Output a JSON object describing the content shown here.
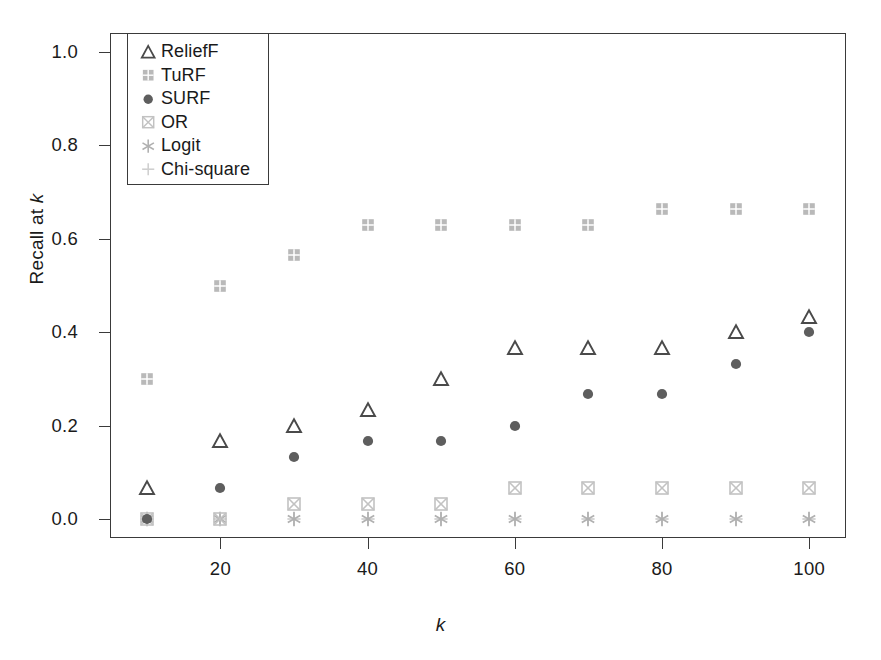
{
  "chart_data": {
    "type": "scatter",
    "title": "",
    "xlabel": "k",
    "ylabel": "Recall at k",
    "xlim": [
      5,
      105
    ],
    "ylim": [
      -0.04,
      1.04
    ],
    "grid": false,
    "legend_position": "top-left",
    "x": [
      10,
      20,
      30,
      40,
      50,
      60,
      70,
      80,
      90,
      100
    ],
    "xticks": [
      20,
      40,
      60,
      80,
      100
    ],
    "xtick_labels": [
      "20",
      "40",
      "60",
      "80",
      "100"
    ],
    "yticks": [
      0.0,
      0.2,
      0.4,
      0.6,
      0.8,
      1.0
    ],
    "ytick_labels": [
      "0.0",
      "0.2",
      "0.4",
      "0.6",
      "0.8",
      "1.0"
    ],
    "series": [
      {
        "name": "ReliefF",
        "marker": "open-triangle",
        "color": "#4a4a4a",
        "values": [
          0.067,
          0.167,
          0.2,
          0.233,
          0.3,
          0.367,
          0.367,
          0.367,
          0.4,
          0.433
        ]
      },
      {
        "name": "TuRF",
        "marker": "filled-square-light",
        "color": "#b9b9b9",
        "values": [
          0.3,
          0.5,
          0.565,
          0.63,
          0.63,
          0.63,
          0.63,
          0.663,
          0.663,
          0.663
        ]
      },
      {
        "name": "SURF",
        "marker": "filled-circle",
        "color": "#5e5e5e",
        "values": [
          0.0,
          0.067,
          0.133,
          0.167,
          0.167,
          0.2,
          0.267,
          0.267,
          0.333,
          0.4
        ]
      },
      {
        "name": "OR",
        "marker": "square-with-x",
        "color": "#c2c2c2",
        "values": [
          0.0,
          0.0,
          0.033,
          0.033,
          0.033,
          0.067,
          0.067,
          0.067,
          0.067,
          0.067
        ]
      },
      {
        "name": "Logit",
        "marker": "asterisk",
        "color": "#b0b0b0",
        "values": [
          0.0,
          0.0,
          0.0,
          0.0,
          0.0,
          0.0,
          0.0,
          0.0,
          0.0,
          0.0
        ]
      },
      {
        "name": "Chi-square",
        "marker": "plus",
        "color": "#cfcfcf",
        "values": [
          0.0,
          0.0,
          0.0,
          0.0,
          0.0,
          0.0,
          0.0,
          0.0,
          0.0,
          0.0
        ]
      }
    ]
  },
  "legend": {
    "entries": [
      {
        "label": "ReliefF"
      },
      {
        "label": "TuRF"
      },
      {
        "label": "SURF"
      },
      {
        "label": "OR"
      },
      {
        "label": "Logit"
      },
      {
        "label": "Chi-square"
      }
    ]
  },
  "axes": {
    "y_title_text": "Recall at ",
    "y_title_italic": "k",
    "x_title_italic": "k"
  },
  "colors": {
    "frame": "#3a3a3a",
    "text": "#1a1a1a",
    "background": "#ffffff"
  }
}
